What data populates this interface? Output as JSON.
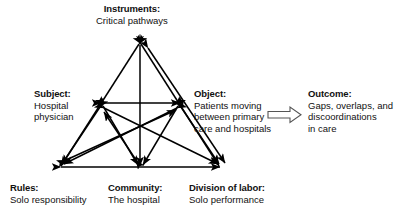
{
  "diagram": {
    "type": "activity-system-triangle",
    "background_color": "#ffffff",
    "stroke_color": "#000000",
    "nodes": {
      "instruments": {
        "title": "Instruments:",
        "line1": "Critical pathways",
        "vertex": "top-apex"
      },
      "subject": {
        "title": "Subject:",
        "line1": "Hospital",
        "line2": "physician",
        "vertex": "mid-left"
      },
      "object": {
        "title": "Object:",
        "line1": "Patients moving",
        "line2": "between primary",
        "line3": "care and hospitals",
        "vertex": "mid-right"
      },
      "outcome": {
        "title": "Outcome:",
        "line1": "Gaps, overlaps, and",
        "line2": "discoordinations",
        "line3": "in care",
        "vertex": "far-right"
      },
      "rules": {
        "title": "Rules:",
        "line1": "Solo responsibility",
        "vertex": "bottom-left"
      },
      "community": {
        "title": "Community:",
        "line1": "The hospital",
        "vertex": "bottom-center"
      },
      "division_of_labor": {
        "title": "Division of labor:",
        "line1": "Solo performance",
        "vertex": "bottom-right"
      }
    },
    "outcome_arrow": {
      "style": "hollow-block-arrow",
      "direction": "right",
      "from": "object",
      "to": "outcome"
    }
  }
}
